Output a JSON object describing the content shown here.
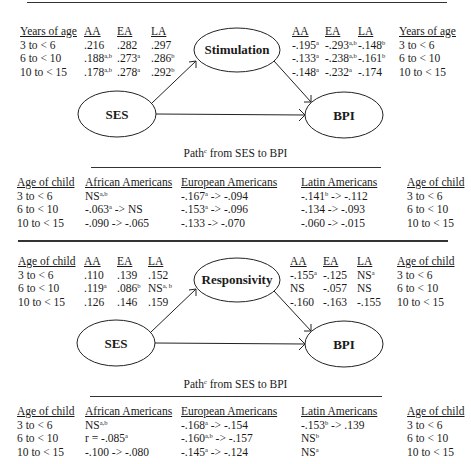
{
  "panel1": {
    "mediator": "Stimulation",
    "exposure": "SES",
    "outcome": "BPI",
    "left_table": {
      "headers": [
        "Years of age",
        "AA",
        "EA",
        "LA"
      ],
      "rows": [
        {
          "age": "3 to < 6",
          "aa": ".216",
          "aa_sup": "",
          "ea": ".282",
          "ea_sup": "",
          "la": ".297",
          "la_sup": ""
        },
        {
          "age": "6 to < 10",
          "aa": ".188",
          "aa_sup": "a,b",
          "ea": ".273",
          "ea_sup": "a",
          "la": ".286",
          "la_sup": "b"
        },
        {
          "age": "10 to < 15",
          "aa": ".178",
          "aa_sup": "a,b",
          "ea": ".278",
          "ea_sup": "a",
          "la": ".292",
          "la_sup": "b"
        }
      ]
    },
    "right_table": {
      "headers": [
        "AA",
        "EA",
        "LA",
        "Years of age"
      ],
      "rows": [
        {
          "aa": "-.195",
          "aa_sup": "a",
          "ea": "-.293",
          "ea_sup": "a,b",
          "la": "-.148",
          "la_sup": "b",
          "age": "3 to < 6"
        },
        {
          "aa": "-.133",
          "aa_sup": "a",
          "ea": "-.238",
          "ea_sup": "a,b",
          "la": "-.161",
          "la_sup": "b",
          "age": "6 to < 10"
        },
        {
          "aa": "-.148",
          "aa_sup": "a",
          "ea": "-.232",
          "ea_sup": "a",
          "la": "-.174",
          "la_sup": "",
          "age": "10 to < 15"
        }
      ]
    },
    "path_caption": {
      "pre": "Path",
      "sup": "c",
      "post": " from SES to BPI"
    },
    "path_table": {
      "headers": [
        "Age of child",
        "African Americans",
        "European Americans",
        "Latin Americans",
        "Age of child"
      ],
      "rows": [
        {
          "age": "3 to < 6",
          "af_a": "NS",
          "af_a_sup": "a,b",
          "af_b": "",
          "eu_a": "-.167",
          "eu_a_sup": "a",
          "eu_b": " -> -.094",
          "la_a": "-.141",
          "la_a_sup": "b",
          "la_b": " -> -.112"
        },
        {
          "age": "6 to < 10",
          "af_a": "-.063",
          "af_a_sup": "a",
          "af_b": " -> NS",
          "eu_a": "-.153",
          "eu_a_sup": "a",
          "eu_b": " -> -.096",
          "la_a": "-.134",
          "la_a_sup": "",
          "la_b": " -> -.093"
        },
        {
          "age": "10 to < 15",
          "af_a": "-.090",
          "af_a_sup": "",
          "af_b": " -> -.065",
          "eu_a": "-.133",
          "eu_a_sup": "",
          "eu_b": " -> -.070",
          "la_a": "-.060",
          "la_a_sup": "",
          "la_b": " -> -.015"
        }
      ]
    }
  },
  "panel2": {
    "mediator": "Responsivity",
    "exposure": "SES",
    "outcome": "BPI",
    "left_table": {
      "headers": [
        "Age of child",
        "AA",
        "EA",
        "LA"
      ],
      "rows": [
        {
          "age": "3 to < 6",
          "aa": ".110",
          "aa_sup": "",
          "ea": ".139",
          "ea_sup": "",
          "la": ".152",
          "la_sup": ""
        },
        {
          "age": "6 to < 10",
          "aa": ".119",
          "aa_sup": "a",
          "ea": ".086",
          "ea_sup": "b",
          "la": "NS",
          "la_sup": "a, b"
        },
        {
          "age": "10 to < 15",
          "aa": ".126",
          "aa_sup": "",
          "ea": ".146",
          "ea_sup": "",
          "la": ".159",
          "la_sup": ""
        }
      ]
    },
    "right_table": {
      "headers": [
        "AA",
        "EA",
        "LA",
        "Age of child"
      ],
      "rows": [
        {
          "aa": "-.155",
          "aa_sup": "a",
          "ea": "-.125",
          "ea_sup": "",
          "la": "NS",
          "la_sup": "a",
          "age": "3 to < 6"
        },
        {
          "aa": "NS",
          "aa_sup": "",
          "ea": "-.057",
          "ea_sup": "",
          "la": "NS",
          "la_sup": "",
          "age": "6 to < 10"
        },
        {
          "aa": "-.160",
          "aa_sup": "",
          "ea": "-.163",
          "ea_sup": "",
          "la": "-.155",
          "la_sup": "",
          "age": "10 to < 15"
        }
      ]
    },
    "path_caption": {
      "pre": "Path",
      "sup": "c",
      "post": " from SES to BPI"
    },
    "path_table": {
      "headers": [
        "Age of child",
        "African Americans",
        "European Americans",
        "Latin Americans",
        "Age of child"
      ],
      "rows": [
        {
          "age": "3 to < 6",
          "af_a": "NS",
          "af_a_sup": "a,b",
          "af_b": "",
          "eu_a": "-.168",
          "eu_a_sup": "a",
          "eu_b": " -> -.154",
          "la_a": "-.153",
          "la_a_sup": "b",
          "la_b": " -> .139"
        },
        {
          "age": "6 to < 10",
          "af_a": "r = -.085",
          "af_a_sup": "a",
          "af_b": "",
          "eu_a": "-.160",
          "eu_a_sup": "a,b",
          "eu_b": " -> -.157",
          "la_a": "NS",
          "la_a_sup": "b",
          "la_b": ""
        },
        {
          "age": "10 to < 15",
          "af_a": "-.100",
          "af_a_sup": "",
          "af_b": " -> -.080",
          "eu_a": "-.145",
          "eu_a_sup": "a",
          "eu_b": " -> -.124",
          "la_a": "NS",
          "la_a_sup": "a",
          "la_b": ""
        }
      ]
    }
  }
}
